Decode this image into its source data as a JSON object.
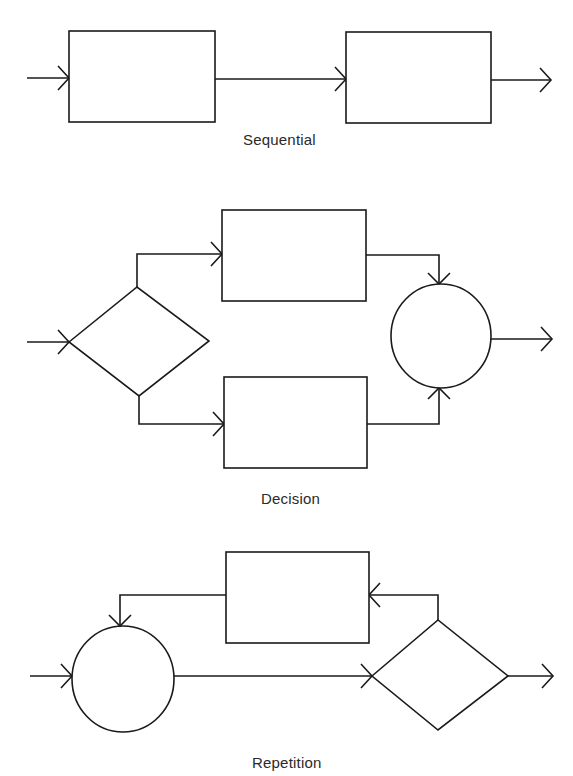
{
  "diagram": {
    "stroke_color": "#1a1a1a",
    "background": "#ffffff",
    "sections": [
      {
        "id": "sequential",
        "caption": "Sequential",
        "nodes": [
          {
            "type": "process-box",
            "label": ""
          },
          {
            "type": "process-box",
            "label": ""
          }
        ],
        "flow": [
          "input",
          "process-box-1",
          "process-box-2",
          "output"
        ]
      },
      {
        "id": "decision",
        "caption": "Decision",
        "nodes": [
          {
            "type": "decision-diamond",
            "label": ""
          },
          {
            "type": "process-box",
            "label": "",
            "branch": "upper"
          },
          {
            "type": "process-box",
            "label": "",
            "branch": "lower"
          },
          {
            "type": "junction-circle",
            "label": ""
          }
        ],
        "flow": [
          "input",
          "decision-diamond",
          "upper-box|lower-box",
          "junction-circle",
          "output"
        ]
      },
      {
        "id": "repetition",
        "caption": "Repetition",
        "nodes": [
          {
            "type": "junction-circle",
            "label": ""
          },
          {
            "type": "decision-diamond",
            "label": ""
          },
          {
            "type": "process-box",
            "label": "",
            "role": "loop-body"
          }
        ],
        "flow": [
          "input",
          "junction-circle",
          "decision-diamond",
          "output"
        ],
        "loop": [
          "decision-diamond",
          "process-box",
          "junction-circle"
        ]
      }
    ]
  }
}
